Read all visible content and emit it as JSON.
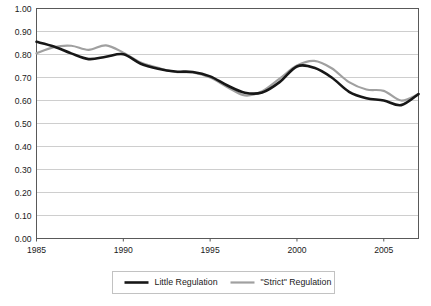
{
  "chart_data": {
    "type": "line",
    "title": "",
    "xlabel": "",
    "ylabel": "",
    "xlim": [
      1985,
      2007
    ],
    "ylim": [
      0.0,
      1.0
    ],
    "grid": true,
    "legend_position": "bottom",
    "x_ticks": [
      "1985",
      "1990",
      "1995",
      "2000",
      "2005"
    ],
    "x_tick_values": [
      1985,
      1990,
      1995,
      2000,
      2005
    ],
    "y_ticks": [
      "0.00",
      "0.10",
      "0.20",
      "0.30",
      "0.40",
      "0.50",
      "0.60",
      "0.70",
      "0.80",
      "0.90",
      "1.00"
    ],
    "y_tick_values": [
      0.0,
      0.1,
      0.2,
      0.3,
      0.4,
      0.5,
      0.6,
      0.7,
      0.8,
      0.9,
      1.0
    ],
    "x": [
      1985,
      1986,
      1987,
      1988,
      1989,
      1990,
      1991,
      1992,
      1993,
      1994,
      1995,
      1996,
      1997,
      1998,
      1999,
      2000,
      2001,
      2002,
      2003,
      2004,
      2005,
      2006,
      2007
    ],
    "series": [
      {
        "name": "Little Regulation",
        "color": "#171717",
        "width": 2.6,
        "values": [
          0.855,
          0.835,
          0.805,
          0.78,
          0.79,
          0.801,
          0.76,
          0.738,
          0.726,
          0.724,
          0.705,
          0.665,
          0.634,
          0.635,
          0.68,
          0.748,
          0.742,
          0.7,
          0.638,
          0.61,
          0.6,
          0.58,
          0.628
        ]
      },
      {
        "name": "\"Strict\" Regulation",
        "color": "#a0a0a0",
        "width": 2.2,
        "values": [
          0.805,
          0.832,
          0.838,
          0.82,
          0.84,
          0.808,
          0.765,
          0.742,
          0.724,
          0.722,
          0.7,
          0.658,
          0.622,
          0.64,
          0.695,
          0.752,
          0.772,
          0.74,
          0.68,
          0.648,
          0.642,
          0.6,
          0.628
        ]
      }
    ]
  },
  "legend": {
    "items": [
      {
        "label": "Little Regulation",
        "color": "#171717"
      },
      {
        "label": "\"Strict\" Regulation",
        "color": "#a0a0a0"
      }
    ]
  }
}
